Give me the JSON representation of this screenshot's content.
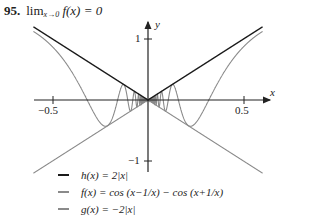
{
  "problem": {
    "number": "95.",
    "lim": "lim",
    "lim_sub": "x→0",
    "expr": "f(x) = 0"
  },
  "axes": {
    "x_label": "x",
    "y_label": "y",
    "x_ticks": [
      "−0.5",
      "0.5"
    ],
    "y_ticks": [
      "1",
      "−1"
    ]
  },
  "legend": [
    {
      "label": "h(x) = 2|x|",
      "color": "#1a1a1a"
    },
    {
      "label": "f(x) = cos (x−1/x) − cos (x+1/x)",
      "color": "#8a8a8a"
    },
    {
      "label": "g(x) = −2|x|",
      "color": "#8a8a8a"
    }
  ],
  "chart_data": {
    "type": "line",
    "xlabel": "x",
    "ylabel": "y",
    "xlim": [
      -0.6,
      0.6
    ],
    "ylim": [
      -1.2,
      1.2
    ],
    "x_ticks": [
      -0.5,
      0.5
    ],
    "y_ticks": [
      1,
      -1
    ],
    "grid": false,
    "legend_position": "bottom-left",
    "series": [
      {
        "name": "h(x) = 2|x|",
        "expr": "2|x|",
        "color": "#1a1a1a"
      },
      {
        "name": "f(x) = cos(x−1/x) − cos(x+1/x)",
        "expr": "2 sin(x) sin(1/x)",
        "color": "#8a8a8a"
      },
      {
        "name": "g(x) = −2|x|",
        "expr": "-2|x|",
        "color": "#8a8a8a"
      }
    ]
  }
}
